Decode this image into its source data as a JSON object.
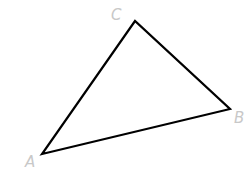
{
  "diagram": {
    "type": "triangle",
    "stroke_color": "#000000",
    "label_color": "#c8c8c8",
    "vertices": [
      {
        "name": "A",
        "x": 42,
        "y": 154
      },
      {
        "name": "B",
        "x": 230,
        "y": 109
      },
      {
        "name": "C",
        "x": 135,
        "y": 21
      }
    ],
    "labels": {
      "A": "A",
      "B": "B",
      "C": "C"
    }
  }
}
